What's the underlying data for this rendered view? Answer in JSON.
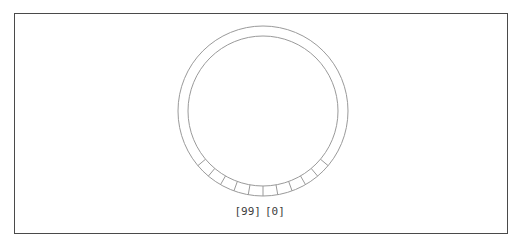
{
  "figure": {
    "title": "",
    "frame": {
      "visible": true,
      "color": "#4a4a4a",
      "x": 14,
      "y": 13,
      "width": 494,
      "height": 221
    },
    "background_color": "#ffffff"
  },
  "dial": {
    "name": "circular-dial",
    "center_x": 263,
    "center_y": 111,
    "outer_radius": 85,
    "inner_radius": 75,
    "stroke_color": "#9a9a9a",
    "stroke_width": 1,
    "ticks": {
      "count": 11,
      "start_angle_deg": -50,
      "end_angle_deg": 50,
      "angle_step_deg": 10,
      "anchor": "bottom-center",
      "description": "radial spokes spanning the bottom arc of the ring"
    }
  },
  "labels": {
    "left": "[99]",
    "right": "[0]",
    "color": "#3d3d3d",
    "font_size_px": 11
  },
  "chart_data": {
    "type": "diagram",
    "title": "",
    "elements": [
      {
        "kind": "circle",
        "role": "outer-ring",
        "cx": 263,
        "cy": 111,
        "r": 85
      },
      {
        "kind": "circle",
        "role": "inner-ring",
        "cx": 263,
        "cy": 111,
        "r": 75
      },
      {
        "kind": "radial-ticks",
        "role": "dial-ticks",
        "count": 11,
        "span_deg": 100
      }
    ],
    "annotations": [
      {
        "text": "[99]",
        "x": 243,
        "y": 212,
        "align": "right"
      },
      {
        "text": "[0]",
        "x": 272,
        "y": 212,
        "align": "left"
      }
    ]
  }
}
